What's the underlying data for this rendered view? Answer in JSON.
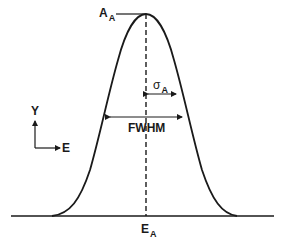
{
  "diagram": {
    "labels": {
      "peak_amplitude": {
        "main": "A",
        "sub": "A"
      },
      "sigma": {
        "main": "σ",
        "sub": "A"
      },
      "fwhm": "FWHM",
      "centroid": {
        "main": "E",
        "sub": "A"
      },
      "y_axis": "Y",
      "x_axis": "E"
    },
    "colors": {
      "line": "#1a1a1a",
      "background": "#ffffff"
    }
  }
}
